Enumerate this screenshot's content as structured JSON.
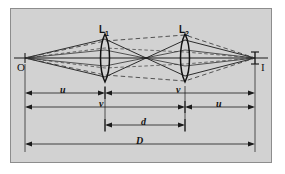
{
  "figure": {
    "background_color": "#d2d2d2",
    "frame_border_color": "#8d8d8d",
    "line_color": "#1a1a1a",
    "dashed_ray_color": "#3a3a3a"
  },
  "points": {
    "object_label": "O",
    "image_label": "I",
    "object_x": 25,
    "image_x": 255,
    "axis_y": 58
  },
  "lenses": [
    {
      "label": "L",
      "subscript": "1",
      "x": 105,
      "center_y": 58,
      "half_height": 24
    },
    {
      "label": "L",
      "subscript": "2",
      "x": 185,
      "center_y": 58,
      "half_height": 24
    }
  ],
  "dimensions": [
    {
      "name": "u-left",
      "label": "u",
      "from_x": 25,
      "to_x": 105,
      "y": 93,
      "label_x": 62,
      "label_y": 87
    },
    {
      "name": "v-right",
      "label": "v",
      "from_x": 105,
      "to_x": 255,
      "y": 93,
      "label_x": 178,
      "label_y": 87
    },
    {
      "name": "v-left",
      "label": "v",
      "from_x": 25,
      "to_x": 185,
      "y": 107,
      "label_x": 101,
      "label_y": 101
    },
    {
      "name": "u-right",
      "label": "u",
      "from_x": 185,
      "to_x": 255,
      "y": 107,
      "label_x": 218,
      "label_y": 101
    },
    {
      "name": "d",
      "label": "d",
      "from_x": 105,
      "to_x": 185,
      "y": 125,
      "label_x": 142,
      "label_y": 119
    },
    {
      "name": "D",
      "label": "D",
      "from_x": 25,
      "to_x": 255,
      "y": 144,
      "label_x": 139,
      "label_y": 138
    }
  ],
  "extension_lines": [
    {
      "name": "object-extension",
      "x": 25,
      "from_y": 64,
      "to_y": 152
    },
    {
      "name": "lens1-extension",
      "x": 105,
      "from_y": 86,
      "to_y": 132
    },
    {
      "name": "lens2-extension",
      "x": 185,
      "from_y": 86,
      "to_y": 132
    },
    {
      "name": "image-extension",
      "x": 255,
      "from_y": 64,
      "to_y": 152
    }
  ]
}
